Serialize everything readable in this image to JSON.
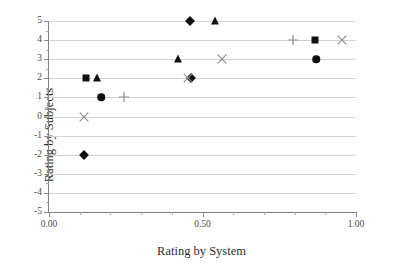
{
  "chart_data": {
    "type": "scatter",
    "title": "",
    "xlabel": "Rating by System",
    "ylabel": "Rating by Subjects",
    "xlim": [
      0.0,
      1.0
    ],
    "ylim": [
      -5,
      5
    ],
    "grid": "horizontal",
    "legend": "none",
    "x_ticks": [
      {
        "value": 0.0,
        "label": "0.00"
      },
      {
        "value": 0.5,
        "label": "0.50"
      },
      {
        "value": 1.0,
        "label": "1.00"
      }
    ],
    "x_minor_tick_step": 0.1,
    "y_ticks": [
      {
        "value": 5,
        "label": "5"
      },
      {
        "value": 4,
        "label": "4"
      },
      {
        "value": 3,
        "label": "3"
      },
      {
        "value": 2,
        "label": "2"
      },
      {
        "value": 1,
        "label": "1"
      },
      {
        "value": 0,
        "label": "0"
      },
      {
        "value": -1,
        "label": "-1"
      },
      {
        "value": -2,
        "label": "-2"
      },
      {
        "value": -3,
        "label": "-3"
      },
      {
        "value": -4,
        "label": "-4"
      },
      {
        "value": -5,
        "label": "-5"
      }
    ],
    "series": [
      {
        "name": "diamond",
        "marker": "diamond",
        "color": "#111111",
        "points": [
          {
            "x": 0.115,
            "y": -2
          },
          {
            "x": 0.462,
            "y": 2
          },
          {
            "x": 0.458,
            "y": 5
          }
        ]
      },
      {
        "name": "square",
        "marker": "square",
        "color": "#111111",
        "points": [
          {
            "x": 0.122,
            "y": 2
          },
          {
            "x": 0.868,
            "y": 4
          }
        ]
      },
      {
        "name": "triangle",
        "marker": "triangle",
        "color": "#111111",
        "points": [
          {
            "x": 0.156,
            "y": 2
          },
          {
            "x": 0.42,
            "y": 3
          },
          {
            "x": 0.54,
            "y": 5
          }
        ]
      },
      {
        "name": "circle",
        "marker": "circle",
        "color": "#111111",
        "points": [
          {
            "x": 0.17,
            "y": 1
          },
          {
            "x": 0.87,
            "y": 3
          }
        ]
      },
      {
        "name": "plus",
        "marker": "plus",
        "color": "#8d8d8d",
        "points": [
          {
            "x": 0.245,
            "y": 1
          },
          {
            "x": 0.795,
            "y": 4
          }
        ]
      },
      {
        "name": "cross",
        "marker": "cross",
        "color": "#8d8d8d",
        "points": [
          {
            "x": 0.114,
            "y": 0
          },
          {
            "x": 0.452,
            "y": 2
          },
          {
            "x": 0.565,
            "y": 3
          },
          {
            "x": 0.955,
            "y": 4
          }
        ]
      }
    ]
  }
}
